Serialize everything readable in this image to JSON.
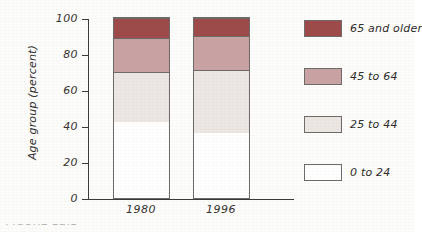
{
  "chart_data": {
    "type": "bar",
    "variant": "stacked-100-percent",
    "title": "",
    "xlabel": "",
    "ylabel": "Age group (percent)",
    "ylim": [
      0,
      100
    ],
    "yticks": [
      0,
      20,
      40,
      60,
      80,
      100
    ],
    "ytick_labels": [
      "0",
      "20",
      "40",
      "60",
      "80",
      "100"
    ],
    "grid": false,
    "legend_position": "right",
    "categories": [
      "1980",
      "1996"
    ],
    "series": [
      {
        "name": "0 to 24",
        "values": [
          42,
          36
        ],
        "color": "#ffffff"
      },
      {
        "name": "25 to 44",
        "values": [
          28,
          35
        ],
        "color": "#ece7e2"
      },
      {
        "name": "45 to 64",
        "values": [
          19,
          19
        ],
        "color": "#c9a3a3"
      },
      {
        "name": "65 and older",
        "values": [
          11,
          10
        ],
        "color": "#9e4a4a"
      }
    ],
    "cumulative_boundaries": {
      "1980": [
        42,
        70,
        89,
        100
      ],
      "1996": [
        36,
        71,
        90,
        100
      ]
    }
  },
  "axis": {
    "y_title": "Age group (percent)",
    "ticks": [
      {
        "label": "100",
        "value": 100
      },
      {
        "label": "80",
        "value": 80
      },
      {
        "label": "60",
        "value": 60
      },
      {
        "label": "40",
        "value": 40
      },
      {
        "label": "20",
        "value": 20
      },
      {
        "label": "0",
        "value": 0
      }
    ]
  },
  "categories": [
    {
      "label": "1980"
    },
    {
      "label": "1996"
    }
  ],
  "legend": {
    "items": [
      {
        "label": "65 and older",
        "color": "#9e4a4a"
      },
      {
        "label": "45 to 64",
        "color": "#c9a3a3"
      },
      {
        "label": "25 to 44",
        "color": "#ece7e2"
      },
      {
        "label": "0 to 24",
        "color": "#ffffff"
      }
    ]
  },
  "caption": {
    "cropped_text": "FIGURE 12.1"
  },
  "colors": {
    "oldest": "#9e4a4a",
    "older": "#c9a3a3",
    "middle": "#ece7e2",
    "youngest": "#ffffff",
    "outline": "#6d6a68",
    "axis": "#3a3a3a",
    "text": "#2f2c2a"
  }
}
